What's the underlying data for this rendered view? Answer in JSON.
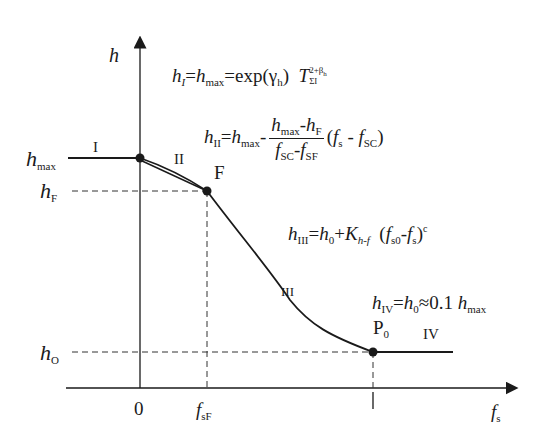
{
  "diagram": {
    "axes": {
      "y_label": "h",
      "x_label_main": "f",
      "x_label_sub": "s",
      "origin_label": "0"
    },
    "y_levels": [
      {
        "name": "h-max",
        "main": "h",
        "sub": "max"
      },
      {
        "name": "h-F",
        "main": "h",
        "sub": "F"
      },
      {
        "name": "h-0",
        "main": "h",
        "sub": "O"
      }
    ],
    "x_ticks": [
      {
        "name": "f-sF",
        "main": "f",
        "sub": "sF"
      },
      {
        "name": "one",
        "label": "I"
      }
    ],
    "points": {
      "F": "F",
      "P0_main": "P",
      "P0_sub": "0"
    },
    "regions": {
      "I": "I",
      "II": "II",
      "III": "III",
      "IV": "IV"
    },
    "equations": {
      "eq1": {
        "lhs_main": "h",
        "lhs_sub": "I",
        "eq": "=",
        "hmax_main": "h",
        "hmax_sub": "max",
        "exp": "=exp(γ",
        "gamma_sub": "h",
        "close": ")",
        "T": "T",
        "T_sub": "ΣΙ",
        "T_sup": "2+β",
        "beta_sub": "h"
      },
      "eq2": {
        "lhs_main": "h",
        "lhs_sub": "II",
        "eq": "=",
        "hmax_main": "h",
        "hmax_sub": "max",
        "minus": "-",
        "num_a_main": "h",
        "num_a_sub": "max",
        "num_minus": "-",
        "num_b_main": "h",
        "num_b_sub": "F",
        "den_a_main": "f",
        "den_a_sub": "SC",
        "den_minus": "-",
        "den_b_main": "f",
        "den_b_sub": "SF",
        "paren_open": "(",
        "fs_main": "f",
        "fs_sub": "s",
        "minus2": " - ",
        "fsc_main": "f",
        "fsc_sub": "SC",
        "paren_close": ")"
      },
      "eq3": {
        "lhs_main": "h",
        "lhs_sub": "III",
        "eq": "=",
        "h0_main": "h",
        "h0_sub": "0",
        "plus": "+",
        "K": "K",
        "K_sub": "h-f",
        "paren_open": "(",
        "fs0_main": "f",
        "fs0_sub": "s0",
        "minus": "-",
        "fs_main": "f",
        "fs_sub": "s",
        "paren_close": ")",
        "exp_c": "c"
      },
      "eq4": {
        "lhs_main": "h",
        "lhs_sub": "IV",
        "eq": "=",
        "h0_main": "h",
        "h0_sub": "0",
        "approx": "≈0.1 ",
        "hmax_main": "h",
        "hmax_sub": "max"
      }
    },
    "colors": {
      "line": "#1a1a1a",
      "dashed": "#333333",
      "background": "#ffffff"
    }
  }
}
